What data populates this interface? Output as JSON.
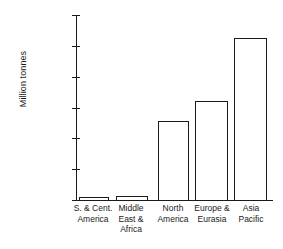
{
  "chart_data": {
    "type": "bar",
    "title": "",
    "subtitle": "",
    "xlabel": "",
    "ylabel": "Million tonnes",
    "ylim": [
      0,
      600000
    ],
    "grid": false,
    "legend": null,
    "number_format": "Indian (lakh) grouping",
    "categories": [
      "S. & Cent. America",
      "Middle East & Africa",
      "North America",
      "Europe & Eurasia",
      "Asia Pacific"
    ],
    "category_lines": [
      [
        "S. & Cent.",
        "America"
      ],
      [
        "Middle",
        "East &",
        "Africa"
      ],
      [
        "North",
        "America"
      ],
      [
        "Europe &",
        "Eurasia"
      ],
      [
        "Asia",
        "Pacific"
      ]
    ],
    "values": [
      13000,
      15000,
      260000,
      323000,
      530000
    ],
    "value_labels": [
      "13,000",
      "15,000",
      "2,60,000",
      "3,23,000",
      "5,30,000"
    ],
    "ytick_values": [
      0,
      100000,
      200000,
      300000,
      400000,
      500000,
      600000
    ],
    "ytick_labels": [
      "0",
      "1,00,000",
      "2,00,000",
      "3,00,000",
      "4,00,000",
      "5,00,000",
      "6,00,000"
    ],
    "bar_style": {
      "fill": "#ffffff",
      "edge": "#1a1a1a",
      "edge_width_px": 1.3
    }
  }
}
